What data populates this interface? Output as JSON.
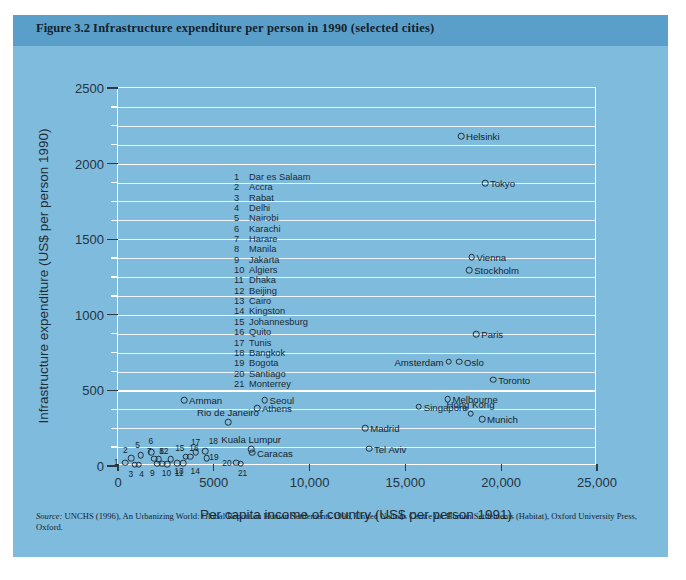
{
  "figure": {
    "number": "Figure 3.2",
    "caption": "Infrastructure expenditure per person in 1990 (selected cities)",
    "source_prefix": "Source:",
    "source_text": " UNCHS (1996), An Urbanizing World: Global Report on Human Settlements 1996, United Nations Centre for Human Settlements (Habitat), Oxford University Press, Oxford.",
    "panel_color": "#7fbbdd",
    "header_color": "#5a9fc9",
    "grid_color": "#ffffff",
    "marker_color": "#213039"
  },
  "chart_data": {
    "type": "scatter",
    "title": "Infrastructure expenditure per person in 1990 (selected cities)",
    "xlabel": "Per capita income of country (US$ per person 1991)",
    "ylabel": "Infrastructure expenditure (US$ per person 1990)",
    "xlim": [
      0,
      25000
    ],
    "ylim": [
      0,
      2500
    ],
    "xticks": [
      0,
      5000,
      10000,
      15000,
      20000,
      25000
    ],
    "xticklabels": [
      "0",
      "5000",
      "10,000",
      "15,000",
      "20,000",
      "25,000"
    ],
    "yticks": [
      0,
      500,
      1000,
      1500,
      2000,
      2500
    ],
    "yticklabels": [
      "0",
      "500",
      "1000",
      "1500",
      "2000",
      "2500"
    ],
    "y_minor_step": 125,
    "grid": true,
    "legend_position": "inside-upper-left",
    "numbered_cities": [
      {
        "n": "1",
        "name": "Dar es Salaam",
        "x": 380,
        "y": 22
      },
      {
        "n": "2",
        "name": "Accra",
        "x": 700,
        "y": 52
      },
      {
        "n": "3",
        "name": "Rabat",
        "x": 880,
        "y": 8
      },
      {
        "n": "4",
        "name": "Delhi",
        "x": 1080,
        "y": 8
      },
      {
        "n": "5",
        "name": "Nairobi",
        "x": 1180,
        "y": 70
      },
      {
        "n": "6",
        "name": "Karachi",
        "x": 1720,
        "y": 92
      },
      {
        "n": "7",
        "name": "Harare",
        "x": 1900,
        "y": 48
      },
      {
        "n": "8",
        "name": "Manila",
        "x": 2120,
        "y": 46
      },
      {
        "n": "9",
        "name": "Jakarta",
        "x": 2050,
        "y": 14
      },
      {
        "n": "10",
        "name": "Algiers",
        "x": 2320,
        "y": 14
      },
      {
        "n": "11",
        "name": "Dhaka",
        "x": 2560,
        "y": 12
      },
      {
        "n": "12",
        "name": "Beijing",
        "x": 2760,
        "y": 46
      },
      {
        "n": "13",
        "name": "Cairo",
        "x": 3080,
        "y": 20
      },
      {
        "n": "14",
        "name": "Kingston",
        "x": 3400,
        "y": 20
      },
      {
        "n": "15",
        "name": "Johannesburg",
        "x": 3540,
        "y": 62
      },
      {
        "n": "16",
        "name": "Quito",
        "x": 3760,
        "y": 62
      },
      {
        "n": "17",
        "name": "Tunis",
        "x": 4050,
        "y": 92
      },
      {
        "n": "18",
        "name": "Bangkok",
        "x": 4560,
        "y": 96
      },
      {
        "n": "19",
        "name": "Bogota",
        "x": 4640,
        "y": 50
      },
      {
        "n": "20",
        "name": "Santiago",
        "x": 6160,
        "y": 22
      },
      {
        "n": "21",
        "name": "Monterrey",
        "x": 6400,
        "y": 14
      }
    ],
    "labelled_cities": [
      {
        "name": "Helsinki",
        "x": 17900,
        "y": 2180,
        "side": "right"
      },
      {
        "name": "Tokyo",
        "x": 19150,
        "y": 1870,
        "side": "right"
      },
      {
        "name": "Vienna",
        "x": 18450,
        "y": 1380,
        "side": "right"
      },
      {
        "name": "Stockholm",
        "x": 18330,
        "y": 1295,
        "side": "right"
      },
      {
        "name": "Paris",
        "x": 18700,
        "y": 870,
        "side": "right"
      },
      {
        "name": "Amsterdam",
        "x": 17250,
        "y": 690,
        "side": "left"
      },
      {
        "name": "Oslo",
        "x": 17800,
        "y": 690,
        "side": "right"
      },
      {
        "name": "Toronto",
        "x": 19580,
        "y": 570,
        "side": "right"
      },
      {
        "name": "Melbourne",
        "x": 17200,
        "y": 440,
        "side": "right"
      },
      {
        "name": "Singapore",
        "x": 15700,
        "y": 392,
        "side": "right"
      },
      {
        "name": "Hong Kong",
        "x": 18400,
        "y": 345,
        "side": "above"
      },
      {
        "name": "Munich",
        "x": 19000,
        "y": 310,
        "side": "right"
      },
      {
        "name": "Amman",
        "x": 3450,
        "y": 437,
        "side": "right"
      },
      {
        "name": "Seoul",
        "x": 7650,
        "y": 437,
        "side": "right"
      },
      {
        "name": "Athens",
        "x": 7250,
        "y": 382,
        "side": "right"
      },
      {
        "name": "Rio de Janeiro",
        "x": 5740,
        "y": 290,
        "side": "above"
      },
      {
        "name": "Madrid",
        "x": 12900,
        "y": 250,
        "side": "right"
      },
      {
        "name": "Kuala Lumpur",
        "x": 6950,
        "y": 110,
        "side": "above"
      },
      {
        "name": "Caracas",
        "x": 7000,
        "y": 88,
        "side": "right"
      },
      {
        "name": "Tel Aviv",
        "x": 13100,
        "y": 115,
        "side": "right"
      }
    ]
  }
}
